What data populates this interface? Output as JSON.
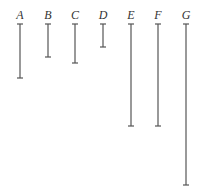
{
  "diagram": {
    "title": "",
    "segments": [
      {
        "label": "A",
        "x": 20,
        "top": 24,
        "bottom": 78
      },
      {
        "label": "B",
        "x": 48,
        "top": 24,
        "bottom": 57
      },
      {
        "label": "C",
        "x": 75,
        "top": 24,
        "bottom": 63
      },
      {
        "label": "D",
        "x": 103,
        "top": 24,
        "bottom": 47
      },
      {
        "label": "E",
        "x": 131,
        "top": 24,
        "bottom": 126
      },
      {
        "label": "F",
        "x": 158,
        "top": 24,
        "bottom": 126
      },
      {
        "label": "G",
        "x": 186,
        "top": 24,
        "bottom": 185
      }
    ]
  }
}
